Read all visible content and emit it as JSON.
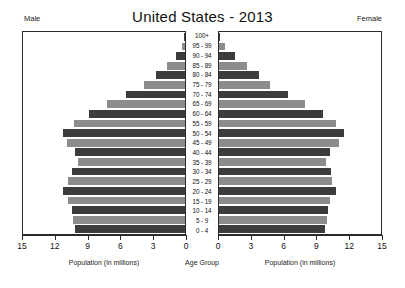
{
  "chart_data": {
    "type": "bar",
    "title": "United States - 2013",
    "subtitle": "",
    "orientation": "population-pyramid",
    "categories": [
      "0 - 4",
      "5 - 9",
      "10 - 14",
      "15 - 19",
      "20 - 24",
      "25 - 29",
      "30 - 34",
      "35 - 39",
      "40 - 44",
      "45 - 49",
      "50 - 54",
      "55 - 59",
      "60 - 64",
      "65 - 69",
      "70 - 74",
      "75 - 79",
      "80 - 84",
      "85 - 89",
      "90 - 94",
      "95 - 99",
      "100+"
    ],
    "series": [
      {
        "name": "Male",
        "values": [
          10.2,
          10.4,
          10.5,
          10.8,
          11.3,
          10.8,
          10.5,
          9.9,
          10.2,
          10.9,
          11.3,
          10.3,
          8.9,
          7.2,
          5.5,
          3.8,
          2.7,
          1.7,
          0.8,
          0.25,
          0.05
        ]
      },
      {
        "name": "Female",
        "values": [
          9.8,
          10.0,
          10.1,
          10.3,
          10.8,
          10.5,
          10.4,
          9.9,
          10.3,
          11.1,
          11.6,
          10.8,
          9.6,
          8.0,
          6.4,
          4.7,
          3.7,
          2.6,
          1.5,
          0.55,
          0.12
        ]
      }
    ],
    "xlabel_left": "Population (in millions)",
    "xlabel_center": "Age Group",
    "xlabel_right": "Population (in millions)",
    "ylabel": "",
    "xlim": [
      0,
      15
    ],
    "left_ticks": [
      "15",
      "12",
      "9",
      "6",
      "3",
      "0"
    ],
    "right_ticks": [
      "0",
      "3",
      "6",
      "9",
      "12",
      "15"
    ],
    "tick_step": 3,
    "grid": false,
    "legend": false,
    "side_labels": {
      "male": "Male",
      "female": "Female"
    },
    "colors": {
      "bar_dark": "#3c3c3c",
      "bar_light": "#8c8c8c",
      "frame": "#2b2b2b",
      "background": "#ffffff"
    }
  }
}
